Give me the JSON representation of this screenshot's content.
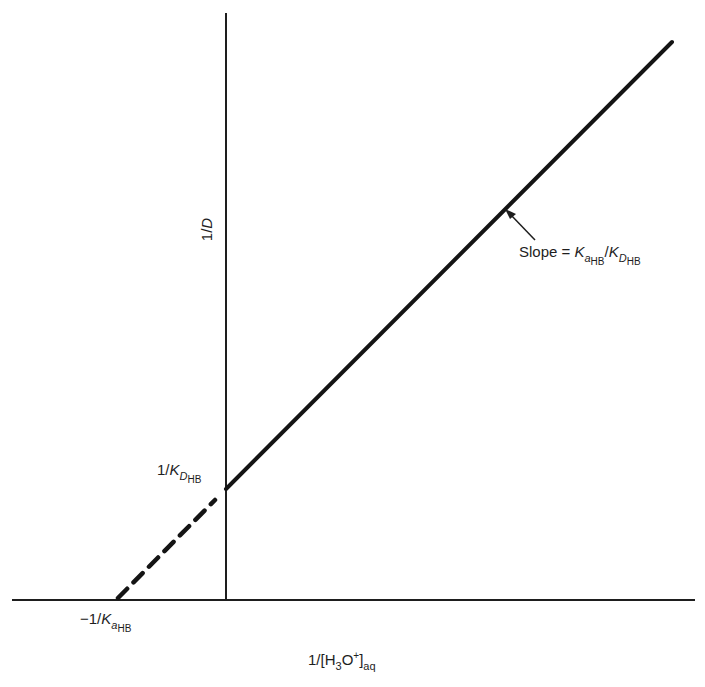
{
  "figure": {
    "type": "linear-plot-schematic",
    "axes": {
      "x_label": {
        "prefix": "1/[H",
        "sub1": "3",
        "mid": "O",
        "sup": "+",
        "close": "]",
        "sub2": "aq"
      },
      "y_label": {
        "text": "1/",
        "var": "D"
      }
    },
    "annotations": {
      "y_intercept": {
        "prefix": "1/",
        "K": "K",
        "sub": "D",
        "subsub": "HB"
      },
      "x_intercept": {
        "prefix": "−1/",
        "K": "K",
        "sub": "a",
        "subsub": "HB"
      },
      "slope": {
        "prefix": "Slope = ",
        "K1": "K",
        "sub1": "a",
        "subsub1": "HB",
        "sep": "/",
        "K2": "K",
        "sub2": "D",
        "subsub2": "HB"
      }
    },
    "lines": {
      "solid_fit": {
        "style": "solid",
        "from": [
          226,
          489
        ],
        "to": [
          672,
          42
        ]
      },
      "extrapolation": {
        "style": "dashed",
        "from": [
          118,
          598
        ],
        "to": [
          215,
          500
        ]
      }
    },
    "colors": {
      "ink": "#1e1e1e",
      "background": "#ffffff"
    }
  }
}
